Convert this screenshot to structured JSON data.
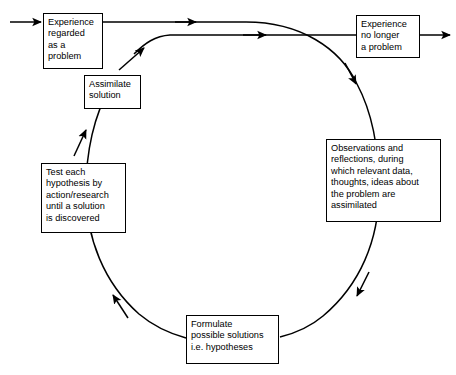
{
  "diagram": {
    "type": "cycle-flow-diagram",
    "direction": "counterclockwise",
    "colors": {
      "background": "#ffffff",
      "stroke": "#000000",
      "text": "#000000"
    },
    "nodes": [
      {
        "id": "experience-problem",
        "label": "Experience\nregarded\nas a\nproblem"
      },
      {
        "id": "assimilate",
        "label": "Assimilate\nsolution"
      },
      {
        "id": "experience-solved",
        "label": "Experience\nno longer\na problem"
      },
      {
        "id": "observations",
        "label": "Observations and\nreflections, during\nwhich relevant data,\nthoughts, ideas about\nthe problem are\nassimilated"
      },
      {
        "id": "test-hypothesis",
        "label": "Test each\nhypothesis by\naction/research\nuntil a solution\nis discovered"
      },
      {
        "id": "formulate",
        "label": "Formulate\npossible solutions\ni.e. hypotheses"
      }
    ],
    "edges": [
      {
        "id": "entry",
        "from": "start",
        "to": "experience-problem"
      },
      {
        "id": "problem-to-cycle",
        "from": "experience-problem",
        "to": "observations"
      },
      {
        "id": "cycle-to-solved",
        "from": "assimilate",
        "to": "experience-solved"
      },
      {
        "id": "exit",
        "from": "experience-solved",
        "to": "end"
      },
      {
        "id": "obs-to-formulate",
        "from": "observations",
        "to": "formulate"
      },
      {
        "id": "formulate-to-test",
        "from": "formulate",
        "to": "test-hypothesis"
      },
      {
        "id": "test-to-assimilate",
        "from": "test-hypothesis",
        "to": "assimilate"
      }
    ]
  }
}
